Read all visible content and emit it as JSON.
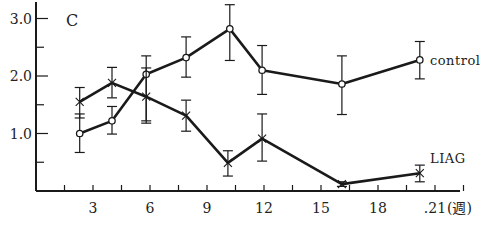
{
  "chart_data": {
    "type": "line",
    "title": "",
    "panel_label": "C",
    "xlabel": "(週)",
    "ylabel": "",
    "x_ticks": [
      3,
      6,
      9,
      12,
      15,
      18,
      21
    ],
    "x_tick_labels": [
      "3",
      "6",
      "9",
      "12",
      "15",
      "18",
      ".21"
    ],
    "y_ticks": [
      1.0,
      2.0,
      3.0
    ],
    "y_tick_labels": [
      "1.0",
      "2.0",
      "3.0"
    ],
    "xlim": [
      0,
      23.5
    ],
    "ylim": [
      0,
      3.2
    ],
    "grid": false,
    "legend": "inline labels at line ends",
    "series": [
      {
        "name": "control",
        "marker": "open-circle",
        "x": [
          2.3,
          4.0,
          5.8,
          7.9,
          10.2,
          11.9,
          16.1,
          20.2
        ],
        "values": [
          1.0,
          1.22,
          2.03,
          2.32,
          2.82,
          2.1,
          1.86,
          2.28
        ],
        "err_low": [
          0.67,
          0.99,
          1.22,
          1.98,
          2.27,
          1.68,
          1.33,
          1.95
        ],
        "err_high": [
          1.34,
          1.47,
          2.35,
          2.68,
          3.24,
          2.53,
          2.35,
          2.6
        ]
      },
      {
        "name": "LIAG",
        "marker": "x-cross",
        "x": [
          2.3,
          4.0,
          5.8,
          7.9,
          10.1,
          11.9,
          16.1,
          20.2
        ],
        "values": [
          1.55,
          1.88,
          1.64,
          1.31,
          0.49,
          0.91,
          0.12,
          0.31
        ],
        "err_low": [
          1.27,
          1.62,
          1.18,
          1.04,
          0.26,
          0.52,
          0.08,
          0.16
        ],
        "err_high": [
          1.8,
          2.15,
          2.14,
          1.58,
          0.7,
          1.34,
          0.16,
          0.45
        ]
      }
    ]
  },
  "labels": {
    "panel": "C",
    "x_unit": "(週)",
    "control": "control",
    "liag": "LIAG"
  }
}
